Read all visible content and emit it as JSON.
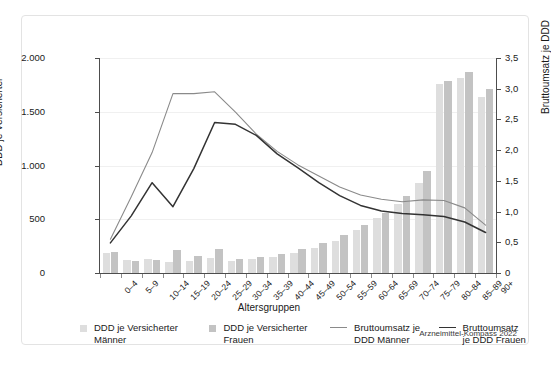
{
  "source_note": "Arzneimittel-Kompass 2022",
  "legend": [
    {
      "key": "ddd-maenner",
      "marker": "bar-swatch-light",
      "label": "DDD je Versicherter Männer"
    },
    {
      "key": "ddd-frauen",
      "marker": "bar-swatch-dark",
      "label": "DDD je Versicherter Frauen"
    },
    {
      "key": "umsatz-maenner",
      "marker": "line-swatch-gray",
      "label": "Bruttoumsatz je DDD Männer"
    },
    {
      "key": "umsatz-frauen",
      "marker": "line-swatch-black",
      "label": "Bruttoumsatz je DDD Frauen"
    }
  ],
  "colors": {
    "bar_maenner": "#dedede",
    "bar_frauen": "#c3c3c3",
    "line_maenner": "#8a8a8a",
    "line_frauen": "#333333",
    "gridline": "#f0f0f0",
    "axis": "#4d4d4d",
    "panel_border": "#e3e3e3"
  },
  "chart_data": {
    "type": "bar",
    "title": "",
    "xlabel": "Altersgruppen",
    "ylabel": "DDD je Versicherter",
    "y2label": "Bruttoumsatz je DDD",
    "grid": true,
    "legend_position": "bottom",
    "ylim": [
      0,
      2000
    ],
    "y2lim": [
      0,
      3.5
    ],
    "yticks": [
      0,
      500,
      1000,
      1500,
      2000
    ],
    "ytick_labels": [
      "0",
      "500",
      "1.000",
      "1.500",
      "2.000"
    ],
    "y2ticks": [
      0,
      0.5,
      1.0,
      1.5,
      2.0,
      2.5,
      3.0,
      3.5
    ],
    "y2tick_labels": [
      "0",
      "0,5",
      "1,0",
      "1,5",
      "2,0",
      "2,5",
      "3,0",
      "3,5"
    ],
    "categories": [
      "0–4",
      "5–9",
      "10–14",
      "15–19",
      "20–24",
      "25–29",
      "30–34",
      "35–39",
      "40–44",
      "45–49",
      "50–54",
      "55–59",
      "60–64",
      "65–69",
      "70–74",
      "75–79",
      "80–84",
      "85–89",
      "90+"
    ],
    "series": [
      {
        "name": "DDD je Versicherter Männer",
        "type": "bar",
        "axis": "left",
        "color": "#dedede",
        "values": [
          188,
          121,
          128,
          98,
          113,
          137,
          116,
          128,
          151,
          186,
          232,
          302,
          398,
          510,
          645,
          836,
          1755,
          1810,
          1635
        ]
      },
      {
        "name": "DDD je Versicherter Frauen",
        "type": "bar",
        "axis": "left",
        "color": "#c3c3c3",
        "values": [
          198,
          113,
          122,
          218,
          159,
          222,
          128,
          149,
          181,
          222,
          277,
          352,
          447,
          560,
          712,
          945,
          1790,
          1870,
          1710
        ]
      },
      {
        "name": "Bruttoumsatz je DDD Männer",
        "type": "line",
        "axis": "right",
        "color": "#8a8a8a",
        "values": [
          0.55,
          1.24,
          1.96,
          2.92,
          2.92,
          2.95,
          2.62,
          2.26,
          1.98,
          1.76,
          1.58,
          1.4,
          1.27,
          1.2,
          1.16,
          1.19,
          1.18,
          1.06,
          0.78
        ]
      },
      {
        "name": "Bruttoumsatz je DDD Frauen",
        "type": "line",
        "axis": "right",
        "color": "#333333",
        "values": [
          0.49,
          0.93,
          1.47,
          1.08,
          1.7,
          2.45,
          2.42,
          2.24,
          1.94,
          1.71,
          1.47,
          1.26,
          1.1,
          1.01,
          0.97,
          0.95,
          0.92,
          0.83,
          0.66
        ]
      }
    ]
  }
}
